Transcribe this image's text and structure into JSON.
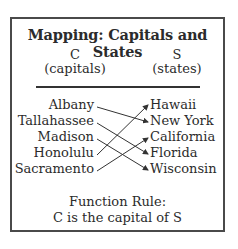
{
  "title": "Mapping: Capitals and States",
  "columns": {
    "left": {
      "symbol": "C",
      "label": "(capitals)"
    },
    "right": {
      "symbol": "S",
      "label": "(states)"
    }
  },
  "capitals": [
    "Albany",
    "Tallahassee",
    "Madison",
    "Honolulu",
    "Sacramento"
  ],
  "states": [
    "Hawaii",
    "New York",
    "California",
    "Florida",
    "Wisconsin"
  ],
  "mappings": [
    {
      "from": "Albany",
      "to": "New York"
    },
    {
      "from": "Tallahassee",
      "to": "Florida"
    },
    {
      "from": "Madison",
      "to": "Wisconsin"
    },
    {
      "from": "Honolulu",
      "to": "Hawaii"
    },
    {
      "from": "Sacramento",
      "to": "California"
    }
  ],
  "function_rule": {
    "heading": "Function Rule:",
    "text": "C is the capital of S"
  },
  "colors": {
    "border": "#4a4a4a",
    "text": "#2b2b2b",
    "arrow": "#333333"
  }
}
